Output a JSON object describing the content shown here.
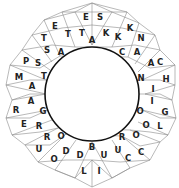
{
  "puzzle": {
    "type": "triangle-ring-word-puzzle",
    "line_color": "#8a8a8a",
    "inner_ring_color": "#111111",
    "letter_color": "#222222",
    "cells": [
      {
        "letter": "E",
        "x": 86,
        "y": 17
      },
      {
        "letter": "S",
        "x": 100,
        "y": 17
      },
      {
        "letter": "E",
        "x": 55,
        "y": 26
      },
      {
        "letter": "T",
        "x": 68,
        "y": 34
      },
      {
        "letter": "T",
        "x": 82,
        "y": 33
      },
      {
        "letter": "A",
        "x": 92,
        "y": 40
      },
      {
        "letter": "K",
        "x": 106,
        "y": 33
      },
      {
        "letter": "K",
        "x": 118,
        "y": 37
      },
      {
        "letter": "K",
        "x": 130,
        "y": 28
      },
      {
        "letter": "N",
        "x": 141,
        "y": 38
      },
      {
        "letter": "T",
        "x": 44,
        "y": 38
      },
      {
        "letter": "S",
        "x": 47,
        "y": 50
      },
      {
        "letter": "A",
        "x": 61,
        "y": 52
      },
      {
        "letter": "C",
        "x": 122,
        "y": 52
      },
      {
        "letter": "A",
        "x": 137,
        "y": 52
      },
      {
        "letter": "P",
        "x": 26,
        "y": 61
      },
      {
        "letter": "S",
        "x": 38,
        "y": 63
      },
      {
        "letter": "A",
        "x": 151,
        "y": 63
      },
      {
        "letter": "C",
        "x": 160,
        "y": 62
      },
      {
        "letter": "M",
        "x": 19,
        "y": 77
      },
      {
        "letter": "T",
        "x": 44,
        "y": 76
      },
      {
        "letter": "N",
        "x": 141,
        "y": 78
      },
      {
        "letter": "H",
        "x": 166,
        "y": 79
      },
      {
        "letter": "A",
        "x": 32,
        "y": 86
      },
      {
        "letter": "I",
        "x": 153,
        "y": 89
      },
      {
        "letter": "A",
        "x": 31,
        "y": 101
      },
      {
        "letter": "I",
        "x": 152,
        "y": 101
      },
      {
        "letter": "R",
        "x": 16,
        "y": 110
      },
      {
        "letter": "G",
        "x": 43,
        "y": 111
      },
      {
        "letter": "O",
        "x": 140,
        "y": 111
      },
      {
        "letter": "G",
        "x": 165,
        "y": 112
      },
      {
        "letter": "E",
        "x": 24,
        "y": 124
      },
      {
        "letter": "R",
        "x": 39,
        "y": 126
      },
      {
        "letter": "O",
        "x": 146,
        "y": 125
      },
      {
        "letter": "L",
        "x": 160,
        "y": 126
      },
      {
        "letter": "R",
        "x": 47,
        "y": 137
      },
      {
        "letter": "O",
        "x": 61,
        "y": 136
      },
      {
        "letter": "R",
        "x": 122,
        "y": 137
      },
      {
        "letter": "O",
        "x": 136,
        "y": 135
      },
      {
        "letter": "B",
        "x": 92,
        "y": 147
      },
      {
        "letter": "U",
        "x": 39,
        "y": 149
      },
      {
        "letter": "D",
        "x": 66,
        "y": 151
      },
      {
        "letter": "D",
        "x": 80,
        "y": 155
      },
      {
        "letter": "U",
        "x": 104,
        "y": 155
      },
      {
        "letter": "U",
        "x": 118,
        "y": 150
      },
      {
        "letter": "C",
        "x": 141,
        "y": 152
      },
      {
        "letter": "O",
        "x": 54,
        "y": 159
      },
      {
        "letter": "C",
        "x": 128,
        "y": 158
      },
      {
        "letter": "L",
        "x": 84,
        "y": 171
      },
      {
        "letter": "I",
        "x": 99,
        "y": 171
      }
    ]
  }
}
